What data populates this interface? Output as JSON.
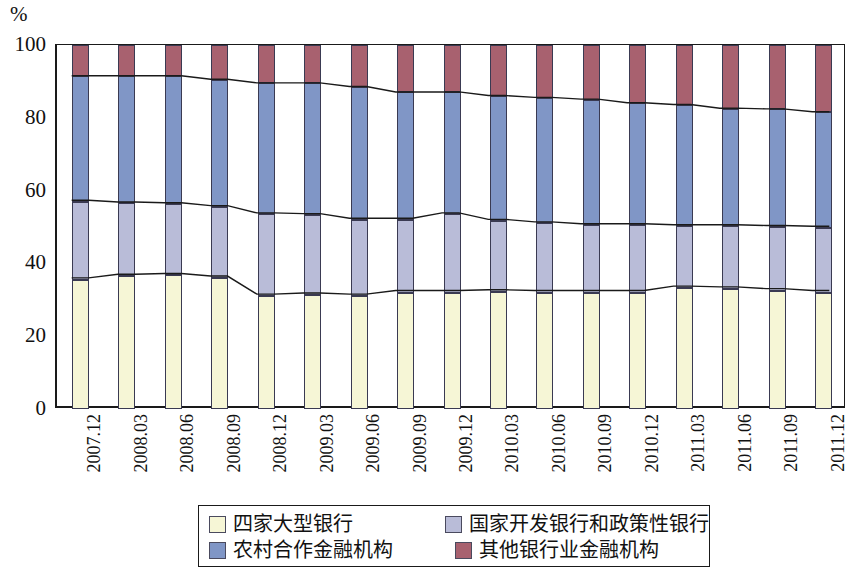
{
  "chart_data": {
    "type": "bar",
    "stacked": true,
    "title": "",
    "subtitle": "",
    "xlabel": "",
    "ylabel": "",
    "unit_label": "%",
    "ylim": [
      0,
      100
    ],
    "yticks": [
      0,
      20,
      40,
      60,
      80,
      100
    ],
    "grid": false,
    "legend_position": "bottom",
    "categories": [
      "2007.12",
      "2008.03",
      "2008.06",
      "2008.09",
      "2008.12",
      "2009.03",
      "2009.06",
      "2009.09",
      "2009.12",
      "2010.03",
      "2010.06",
      "2010.09",
      "2010.12",
      "2011.03",
      "2011.06",
      "2011.09",
      "2011.12"
    ],
    "series": [
      {
        "name": "四家大型银行",
        "color": "#f6f6d6",
        "values": [
          35.5,
          36.5,
          36.7,
          36.0,
          31.0,
          31.3,
          31.0,
          32.0,
          32.0,
          32.2,
          32.0,
          32.0,
          32.0,
          33.2,
          33.0,
          32.5,
          32.0
        ]
      },
      {
        "name": "国家开发银行和政策性银行",
        "color": "#b9bcd8",
        "values": [
          21.5,
          20.0,
          19.6,
          19.5,
          22.5,
          22.0,
          21.0,
          20.0,
          21.5,
          19.5,
          19.0,
          18.5,
          18.5,
          17.0,
          17.2,
          17.5,
          17.8
        ]
      },
      {
        "name": "农村合作金融机构",
        "color": "#8096c6",
        "values": [
          34.5,
          35.0,
          35.2,
          35.0,
          36.0,
          36.2,
          36.5,
          35.0,
          33.5,
          34.3,
          34.5,
          34.5,
          33.5,
          33.3,
          32.3,
          32.3,
          31.7
        ]
      },
      {
        "name": "其他银行业金融机构",
        "color": "#a8616f",
        "values": [
          8.5,
          8.5,
          8.5,
          9.5,
          10.5,
          10.5,
          11.5,
          13.0,
          13.0,
          14.0,
          14.5,
          15.0,
          16.0,
          16.5,
          17.5,
          17.7,
          18.5
        ]
      }
    ],
    "cumulative_boundaries": {
      "top_of_series1": [
        35.5,
        36.5,
        36.7,
        36.0,
        31.0,
        31.3,
        31.0,
        32.0,
        32.0,
        32.2,
        32.0,
        32.0,
        32.0,
        33.2,
        33.0,
        32.5,
        32.0
      ],
      "top_of_series2": [
        57.0,
        56.5,
        56.3,
        55.5,
        53.5,
        53.3,
        52.0,
        52.0,
        53.5,
        51.7,
        51.0,
        50.5,
        50.5,
        50.2,
        50.2,
        50.0,
        49.8
      ],
      "top_of_series3": [
        91.5,
        91.5,
        91.5,
        90.5,
        89.5,
        89.5,
        88.5,
        87.0,
        87.0,
        86.0,
        85.5,
        85.0,
        84.0,
        83.5,
        82.5,
        82.3,
        81.5
      ],
      "top_of_series4": [
        100,
        100,
        100,
        100,
        100,
        100,
        100,
        100,
        100,
        100,
        100,
        100,
        100,
        100,
        100,
        100,
        100
      ]
    }
  },
  "legend": {
    "items": [
      {
        "label": "四家大型银行",
        "color": "#f6f6d6"
      },
      {
        "label": "国家开发银行和政策性银行",
        "color": "#b9bcd8"
      },
      {
        "label": "农村合作金融机构",
        "color": "#8096c6"
      },
      {
        "label": "其他银行业金融机构",
        "color": "#a8616f"
      }
    ]
  }
}
